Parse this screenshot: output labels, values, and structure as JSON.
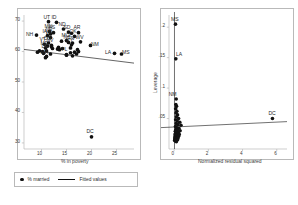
{
  "figure": {
    "background": "#ffffff",
    "marker_color": "#111111",
    "line_color": "#111111",
    "axis_color": "#b9b9b9"
  },
  "legend": {
    "marker_label": "% married",
    "line_label": "Fitted values",
    "marker_icon": "filled-circle-icon",
    "line_icon": "line-segment-icon"
  },
  "chart_data": [
    {
      "id": "scatter_married_poverty",
      "type": "scatter",
      "title": "",
      "xlabel": "% in poverty",
      "ylabel": "",
      "xlim": [
        6.5,
        28.5
      ],
      "ylim": [
        28,
        72
      ],
      "xticks": [
        10,
        15,
        20,
        25
      ],
      "yticks": [
        70,
        60,
        50,
        40,
        30
      ],
      "grid": false,
      "legend_position": "below",
      "fit_line": {
        "name": "Fitted values",
        "x": [
          6.5,
          28.5
        ],
        "y": [
          60.7,
          56.2
        ]
      },
      "points": [
        {
          "label": "UT",
          "x": 11.4,
          "y": 69.8
        },
        {
          "label": "ID",
          "x": 13.0,
          "y": 69.6
        },
        {
          "label": "NH",
          "x": 9.0,
          "y": 65.4
        },
        {
          "label": "MN",
          "x": 11.6,
          "y": 66.6
        },
        {
          "label": "KS",
          "x": 12.4,
          "y": 66.2
        },
        {
          "label": "NE",
          "x": 11.8,
          "y": 65.8
        },
        {
          "label": "IA",
          "x": 11.2,
          "y": 65.2
        },
        {
          "label": "WI",
          "x": 11.8,
          "y": 64.6
        },
        {
          "label": "ND",
          "x": 14.4,
          "y": 67.4
        },
        {
          "label": "SD",
          "x": 15.4,
          "y": 66.4
        },
        {
          "label": "WY",
          "x": 16.0,
          "y": 66.0
        },
        {
          "label": "AR",
          "x": 17.4,
          "y": 66.2
        },
        {
          "label": "OK",
          "x": 16.6,
          "y": 65.0
        },
        {
          "label": "MO",
          "x": 15.0,
          "y": 63.6
        },
        {
          "label": "IN",
          "x": 14.0,
          "y": 63.4
        },
        {
          "label": "NC",
          "x": 15.4,
          "y": 63.0
        },
        {
          "label": "TN",
          "x": 16.2,
          "y": 62.8
        },
        {
          "label": "KY",
          "x": 16.0,
          "y": 62.2
        },
        {
          "label": "WV",
          "x": 17.8,
          "y": 63.2
        },
        {
          "label": "NM",
          "x": 19.8,
          "y": 62.0
        },
        {
          "label": "NV",
          "x": 12.0,
          "y": 62.0
        },
        {
          "label": "CO",
          "x": 11.4,
          "y": 62.8
        },
        {
          "label": "VT",
          "x": 10.6,
          "y": 62.4
        },
        {
          "label": "ME",
          "x": 10.8,
          "y": 61.2
        },
        {
          "label": "OR",
          "x": 12.0,
          "y": 61.6
        },
        {
          "label": "WA",
          "x": 11.2,
          "y": 61.8
        },
        {
          "label": "OH",
          "x": 13.4,
          "y": 61.4
        },
        {
          "label": "MI",
          "x": 14.2,
          "y": 61.0
        },
        {
          "label": "IL",
          "x": 13.6,
          "y": 60.6
        },
        {
          "label": "PA",
          "x": 13.2,
          "y": 60.8
        },
        {
          "label": "VA",
          "x": 12.2,
          "y": 61.0
        },
        {
          "label": "MT",
          "x": 15.8,
          "y": 61.2
        },
        {
          "label": "AZ",
          "x": 17.2,
          "y": 60.6
        },
        {
          "label": "TX",
          "x": 17.4,
          "y": 60.0
        },
        {
          "label": "SC",
          "x": 16.6,
          "y": 59.8
        },
        {
          "label": "GA",
          "x": 15.8,
          "y": 59.6
        },
        {
          "label": "AL",
          "x": 17.0,
          "y": 59.2
        },
        {
          "label": "FL",
          "x": 15.0,
          "y": 59.0
        },
        {
          "label": "CT",
          "x": 9.6,
          "y": 60.2
        },
        {
          "label": "NJ",
          "x": 10.2,
          "y": 60.0
        },
        {
          "label": "MD",
          "x": 10.4,
          "y": 59.4
        },
        {
          "label": "DE",
          "x": 11.0,
          "y": 60.2
        },
        {
          "label": "NY",
          "x": 15.0,
          "y": 58.8
        },
        {
          "label": "CA",
          "x": 16.2,
          "y": 58.6
        },
        {
          "label": "RI",
          "x": 11.8,
          "y": 59.2
        },
        {
          "label": "MA",
          "x": 10.8,
          "y": 58.0
        },
        {
          "label": "AK",
          "x": 9.2,
          "y": 59.8
        },
        {
          "label": "HI",
          "x": 11.0,
          "y": 58.4
        },
        {
          "label": "LA",
          "x": 24.6,
          "y": 59.4
        },
        {
          "label": "MS",
          "x": 26.0,
          "y": 59.2
        },
        {
          "label": "DC",
          "x": 20.0,
          "y": 32.0
        }
      ],
      "visible_labels": [
        "UT",
        "ID",
        "NH",
        "ND",
        "AR",
        "NM",
        "LA",
        "MS",
        "DC",
        "MN",
        "KS",
        "NE",
        "IA",
        "WI",
        "SD",
        "OK",
        "MO",
        "NC",
        "TN",
        "KY",
        "WV",
        "MA",
        "VT",
        "DE",
        "ME",
        "CO",
        "FL",
        "NV"
      ]
    },
    {
      "id": "leverage_residual_plot",
      "type": "scatter",
      "title": "",
      "xlabel": "Normalized residual squared",
      "ylabel": "Leverage",
      "xlim": [
        -0.3,
        6.6
      ],
      "ylim": [
        0,
        0.22
      ],
      "xticks": [
        0,
        2,
        4,
        6
      ],
      "yticks": [
        0.2,
        0.15,
        0.1,
        0.05
      ],
      "ytick_labels": [
        ".2",
        ".15",
        ".1",
        ".05"
      ],
      "grid": false,
      "legend_position": "none",
      "reference_lines": {
        "horizontal_y": 0.0392,
        "vertical_x": 0.02
      },
      "points": [
        {
          "label": "MS",
          "x": 0.08,
          "y": 0.205
        },
        {
          "label": "LA",
          "x": 0.1,
          "y": 0.148
        },
        {
          "label": "NM",
          "x": 0.12,
          "y": 0.082
        },
        {
          "label": "DC",
          "x": 5.75,
          "y": 0.05
        },
        {
          "label": "",
          "x": 0.1,
          "y": 0.073
        },
        {
          "label": "",
          "x": 0.14,
          "y": 0.07
        },
        {
          "label": "",
          "x": 0.09,
          "y": 0.066
        },
        {
          "label": "",
          "x": 0.16,
          "y": 0.062
        },
        {
          "label": "",
          "x": 0.11,
          "y": 0.059
        },
        {
          "label": "",
          "x": 0.2,
          "y": 0.056
        },
        {
          "label": "",
          "x": 0.13,
          "y": 0.053
        },
        {
          "label": "",
          "x": 0.26,
          "y": 0.05
        },
        {
          "label": "",
          "x": 0.09,
          "y": 0.048
        },
        {
          "label": "",
          "x": 0.18,
          "y": 0.046
        },
        {
          "label": "",
          "x": 0.33,
          "y": 0.044
        },
        {
          "label": "",
          "x": 0.12,
          "y": 0.042
        },
        {
          "label": "",
          "x": 0.22,
          "y": 0.04
        },
        {
          "label": "",
          "x": 0.4,
          "y": 0.039
        },
        {
          "label": "",
          "x": 0.08,
          "y": 0.037
        },
        {
          "label": "",
          "x": 0.15,
          "y": 0.035
        },
        {
          "label": "",
          "x": 0.28,
          "y": 0.034
        },
        {
          "label": "",
          "x": 0.1,
          "y": 0.032
        },
        {
          "label": "",
          "x": 0.19,
          "y": 0.031
        },
        {
          "label": "",
          "x": 0.35,
          "y": 0.03
        },
        {
          "label": "",
          "x": 0.07,
          "y": 0.029
        },
        {
          "label": "",
          "x": 0.13,
          "y": 0.028
        },
        {
          "label": "",
          "x": 0.24,
          "y": 0.027
        },
        {
          "label": "",
          "x": 0.09,
          "y": 0.026
        },
        {
          "label": "",
          "x": 0.17,
          "y": 0.025
        },
        {
          "label": "",
          "x": 0.3,
          "y": 0.024
        },
        {
          "label": "",
          "x": 0.06,
          "y": 0.024
        },
        {
          "label": "",
          "x": 0.11,
          "y": 0.023
        },
        {
          "label": "",
          "x": 0.21,
          "y": 0.022
        },
        {
          "label": "",
          "x": 0.08,
          "y": 0.022
        },
        {
          "label": "",
          "x": 0.14,
          "y": 0.021
        },
        {
          "label": "",
          "x": 0.26,
          "y": 0.021
        },
        {
          "label": "",
          "x": 0.05,
          "y": 0.02
        },
        {
          "label": "",
          "x": 0.1,
          "y": 0.02
        },
        {
          "label": "",
          "x": 0.18,
          "y": 0.019
        },
        {
          "label": "",
          "x": 0.07,
          "y": 0.019
        },
        {
          "label": "",
          "x": 0.12,
          "y": 0.018
        },
        {
          "label": "",
          "x": 0.23,
          "y": 0.018
        },
        {
          "label": "",
          "x": 0.04,
          "y": 0.017
        },
        {
          "label": "",
          "x": 0.09,
          "y": 0.017
        },
        {
          "label": "",
          "x": 0.16,
          "y": 0.016
        },
        {
          "label": "",
          "x": 0.06,
          "y": 0.016
        },
        {
          "label": "",
          "x": 0.11,
          "y": 0.015
        },
        {
          "label": "",
          "x": 0.2,
          "y": 0.015
        },
        {
          "label": "",
          "x": 0.03,
          "y": 0.014
        },
        {
          "label": "",
          "x": 0.08,
          "y": 0.013
        },
        {
          "label": "",
          "x": 0.13,
          "y": 0.012
        }
      ],
      "visible_labels": [
        "MS",
        "LA",
        "NM",
        "DC"
      ]
    }
  ]
}
